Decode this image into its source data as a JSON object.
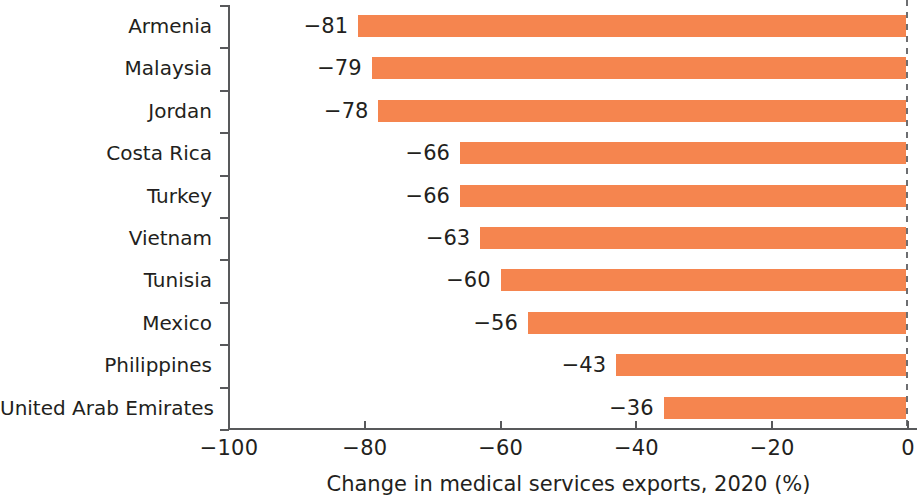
{
  "chart_data": {
    "type": "bar",
    "orientation": "horizontal",
    "title": "",
    "xlabel": "Change in medical services exports, 2020 (%)",
    "ylabel": "",
    "categories": [
      "Armenia",
      "Malaysia",
      "Jordan",
      "Costa Rica",
      "Turkey",
      "Vietnam",
      "Tunisia",
      "Mexico",
      "Philippines",
      "United Arab Emirates"
    ],
    "values": [
      -81,
      -79,
      -78,
      -66,
      -66,
      -63,
      -60,
      -56,
      -43,
      -36
    ],
    "value_labels": [
      "−81",
      "−79",
      "−78",
      "−66",
      "−66",
      "−63",
      "−60",
      "−56",
      "−43",
      "−36"
    ],
    "xlim": [
      -100,
      0
    ],
    "xticks": [
      -100,
      -80,
      -60,
      -40,
      -20,
      0
    ],
    "xtick_labels": [
      "−100",
      "−80",
      "−60",
      "−40",
      "−20",
      "0"
    ],
    "grid": false,
    "legend": false,
    "bar_color": "#f5854f",
    "axis_color": "#58595b",
    "text_color": "#231f20",
    "zero_reference_line": {
      "value": 0,
      "style": "dashed",
      "color": "#6d6e71"
    }
  }
}
